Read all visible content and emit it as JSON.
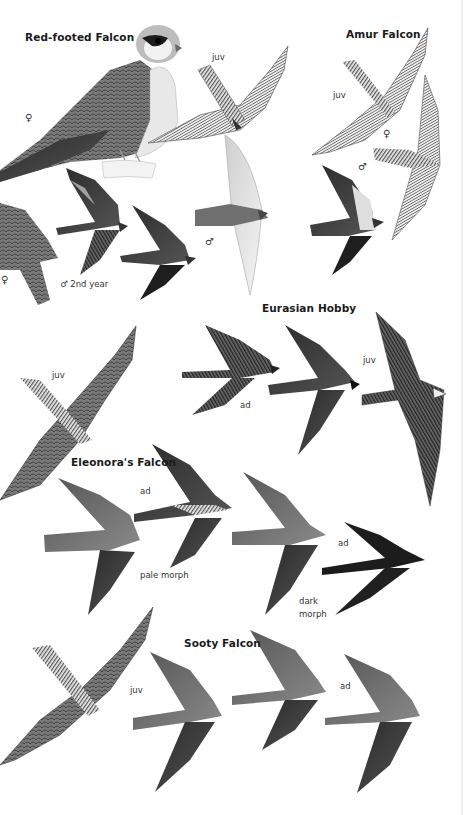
{
  "plate": {
    "species": [
      {
        "name": "Red-footed Falcon",
        "labels": [
          "♀",
          "juv",
          "♀",
          "♂ 2nd year",
          "♂"
        ]
      },
      {
        "name": "Amur Falcon",
        "labels": [
          "juv",
          "♀",
          "♂"
        ]
      },
      {
        "name": "Eurasian Hobby",
        "labels": [
          "juv",
          "ad",
          "juv"
        ]
      },
      {
        "name": "Eleonora's Falcon",
        "labels": [
          "ad",
          "pale morph",
          "ad",
          "dark morph"
        ]
      },
      {
        "name": "Sooty Falcon",
        "labels": [
          "juv",
          "ad"
        ]
      }
    ],
    "titles": {
      "red_footed": "Red-footed Falcon",
      "amur": "Amur Falcon",
      "hobby": "Eurasian Hobby",
      "eleonora": "Eleonora's Falcon",
      "sooty": "Sooty Falcon"
    },
    "labels": {
      "rf_female_perched": "♀",
      "rf_juv": "juv",
      "rf_female_flight": "♀",
      "rf_male_2nd_year": "♂ 2nd year",
      "rf_male": "♂",
      "amur_juv": "juv",
      "amur_female": "♀",
      "amur_male": "♂",
      "hobby_juv_left": "juv",
      "hobby_ad": "ad",
      "hobby_juv_right": "juv",
      "eleonora_ad_pale": "ad",
      "eleonora_pale_morph": "pale morph",
      "eleonora_ad_dark": "ad",
      "eleonora_dark_morph_1": "dark",
      "eleonora_dark_morph_2": "morph",
      "sooty_juv": "juv",
      "sooty_ad": "ad"
    }
  }
}
